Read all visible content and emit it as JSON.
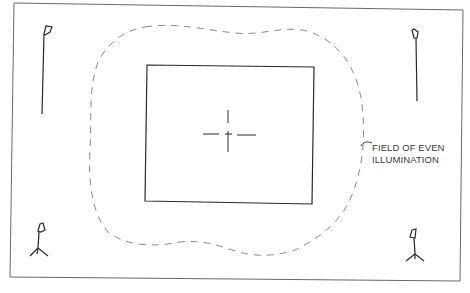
{
  "diagram": {
    "type": "lighting-plan",
    "colors": {
      "ink": "#2a2a2a",
      "dashed": "#8a8a8a",
      "frame": "#6a6a6a",
      "background": "#ffffff"
    },
    "elements": {
      "outer_frame": "studio-floor-outline",
      "subject_area": "rectangle",
      "center_mark": "crosshair",
      "field_boundary": "dashed-curve"
    },
    "lamps": [
      {
        "position": "top-left",
        "style": "tall-stand"
      },
      {
        "position": "top-right",
        "style": "tall-stand"
      },
      {
        "position": "bottom-left",
        "style": "tripod"
      },
      {
        "position": "bottom-right",
        "style": "tripod"
      }
    ],
    "label": {
      "line1": "FIELD OF EVEN",
      "line2": "ILLUMINATION"
    }
  }
}
